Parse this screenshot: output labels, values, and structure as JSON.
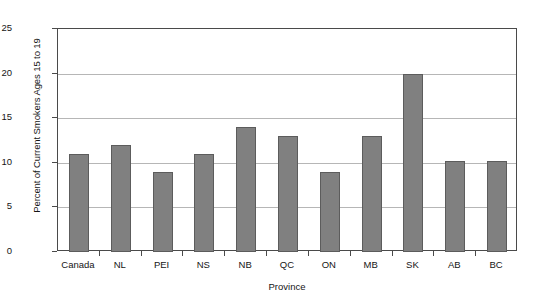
{
  "chart_data": {
    "type": "bar",
    "title": "",
    "xlabel": "Province",
    "ylabel": "Percent of Current Smokers Ages 15 to 19",
    "categories": [
      "Canada",
      "NL",
      "PEI",
      "NS",
      "NB",
      "QC",
      "ON",
      "MB",
      "SK",
      "AB",
      "BC"
    ],
    "values": [
      11,
      12,
      9,
      11,
      14,
      13,
      9,
      13,
      20,
      10.2,
      10.2
    ],
    "series": [
      {
        "name": "Percent of current smokers ages 15 to 19",
        "values": [
          11,
          12,
          9,
          11,
          14,
          13,
          9,
          13,
          20,
          10.2,
          10.2
        ]
      }
    ],
    "ylim": [
      0,
      25
    ],
    "yticks": [
      0,
      5,
      10,
      15,
      20,
      25
    ],
    "ytick_labels": [
      "0",
      "5",
      "10",
      "15",
      "20",
      "25"
    ],
    "grid": true,
    "legend": "none",
    "bar_color": "#808080",
    "bar_edge_color": "#5c5c5c",
    "gridline_color": "#b6b6b6",
    "axis_color": "#4a4a4a",
    "background_color": "#ffffff"
  }
}
